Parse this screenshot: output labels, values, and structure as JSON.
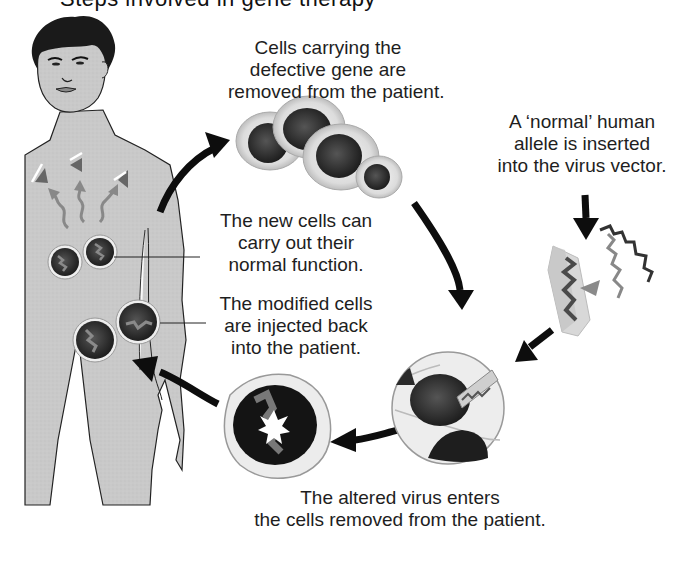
{
  "title": {
    "cropped_text": "Steps involved in gene therapy"
  },
  "labels": {
    "removed": [
      "Cells carrying the",
      "defective gene are",
      "removed from the patient."
    ],
    "allele": [
      "A ‘normal’ human",
      "allele is inserted",
      "into the virus vector."
    ],
    "new_cells": [
      "The new cells can",
      "carry out their",
      "normal function."
    ],
    "injected": [
      "The modified cells",
      "are injected back",
      "into the patient."
    ],
    "virus_enters": [
      "The altered virus enters",
      "the cells removed from the patient."
    ]
  },
  "figures": {
    "patient": "human-figure",
    "removed_cells": "cell-cluster",
    "virus_vector": "virus-capsid-with-allele",
    "infected_cell": "cell-with-virus-entering",
    "modified_cell": "cell-with-altered-dna"
  },
  "colors": {
    "skin": "#c8c8c8",
    "outline": "#1a1a1a",
    "nucleus": "#2a2a2a",
    "cytoplasm": "#e6e6e6",
    "arrow": "#0d0d0d",
    "dna": "#7a7a7a"
  }
}
